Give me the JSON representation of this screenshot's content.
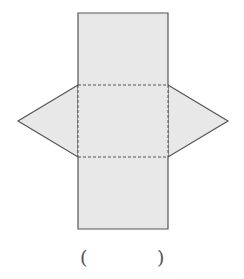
{
  "figure": {
    "fill_color": "#e8e8e8",
    "stroke_color": "#555555",
    "fold_line_style": "dashed",
    "shapes": {
      "rect_top": {
        "x": 78,
        "y": 13,
        "w": 90,
        "h": 72
      },
      "rect_middle": {
        "x": 78,
        "y": 85,
        "w": 90,
        "h": 72
      },
      "rect_bottom": {
        "x": 78,
        "y": 157,
        "w": 90,
        "h": 72
      },
      "triangle_left": {
        "points": "78,85 18,121 78,157"
      },
      "triangle_right": {
        "points": "168,85 228,121 168,157"
      }
    }
  },
  "answer": {
    "open_paren": "(",
    "close_paren": ")",
    "value": ""
  }
}
